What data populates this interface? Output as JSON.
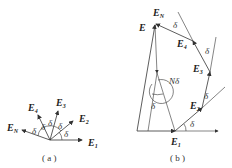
{
  "figure_a": {
    "caption": "( a )",
    "vectors": [
      {
        "name": "E",
        "sub": "1"
      },
      {
        "name": "E",
        "sub": "2"
      },
      {
        "name": "E",
        "sub": "3"
      },
      {
        "name": "E",
        "sub": "4"
      },
      {
        "name": "E",
        "sub": "N"
      }
    ],
    "angle_label": "δ"
  },
  "figure_b": {
    "caption": "( b )",
    "resultant_label": "E",
    "vectors": [
      {
        "name": "E",
        "sub": "1"
      },
      {
        "name": "E",
        "sub": "2"
      },
      {
        "name": "E",
        "sub": "3"
      },
      {
        "name": "E",
        "sub": "4"
      },
      {
        "name": "E",
        "sub": "N"
      }
    ],
    "angle_label": "δ",
    "total_angle_label": "Nδ"
  },
  "colors": {
    "line": "#333333",
    "background": "#ffffff"
  }
}
